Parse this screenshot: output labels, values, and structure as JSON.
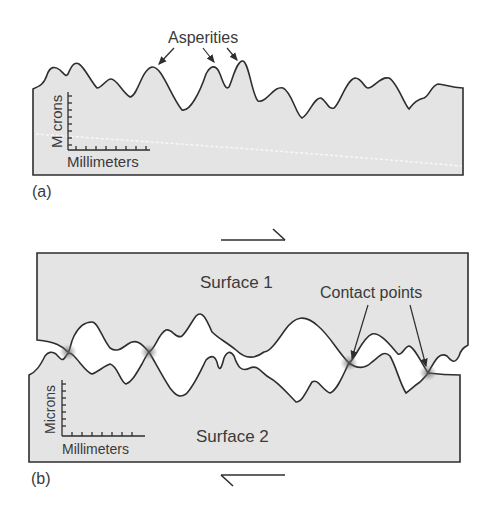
{
  "panel_a": {
    "tag": "(a)",
    "annotation": "Asperities",
    "axis_y_label": "M crons",
    "axis_x_label": "Millimeters"
  },
  "panel_b": {
    "tag": "(b)",
    "surface_top_label": "Surface 1",
    "surface_bottom_label": "Surface 2",
    "annotation": "Contact points",
    "axis_y_label": "Microns",
    "axis_x_label": "Millimeters"
  },
  "colors": {
    "fill": "#e4e4e4",
    "line": "#2e2e2e",
    "text": "#3a3a3a"
  }
}
